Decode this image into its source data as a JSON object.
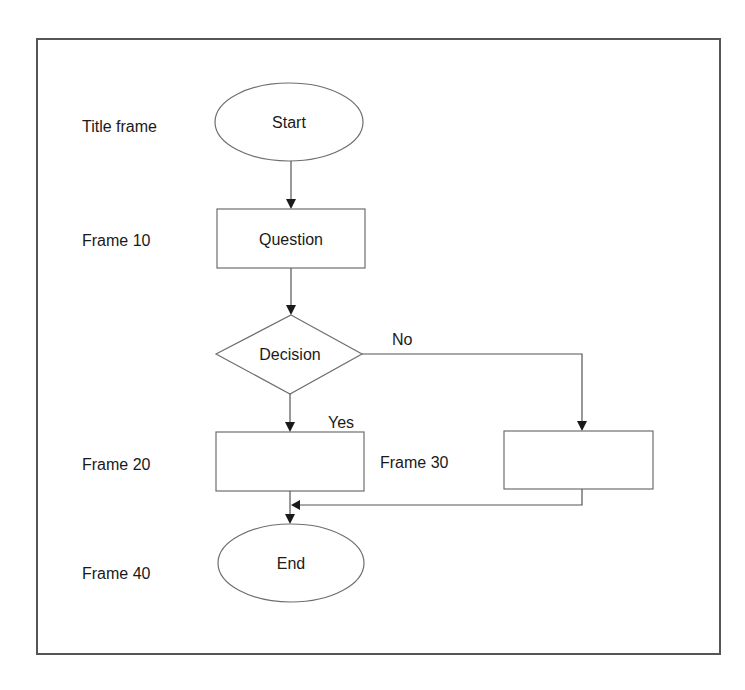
{
  "diagram": {
    "type": "flowchart",
    "colors": {
      "stroke": "#6e6e6e",
      "frame": "#555555",
      "text": "#1a1a1a",
      "background": "#ffffff"
    },
    "row_labels": {
      "title_frame": "Title frame",
      "frame_10": "Frame 10",
      "frame_20": "Frame 20",
      "frame_30": "Frame 30",
      "frame_40": "Frame 40"
    },
    "nodes": {
      "start": {
        "shape": "ellipse",
        "label": "Start"
      },
      "question": {
        "shape": "rectangle",
        "label": "Question"
      },
      "decision": {
        "shape": "diamond",
        "label": "Decision"
      },
      "frame20_box": {
        "shape": "rectangle",
        "label": ""
      },
      "frame30_box": {
        "shape": "rectangle",
        "label": ""
      },
      "end": {
        "shape": "ellipse",
        "label": "End"
      }
    },
    "edge_labels": {
      "no": "No",
      "yes": "Yes"
    },
    "edges": [
      {
        "from": "start",
        "to": "question"
      },
      {
        "from": "question",
        "to": "decision"
      },
      {
        "from": "decision",
        "to": "frame20_box",
        "label": "Yes"
      },
      {
        "from": "decision",
        "to": "frame30_box",
        "label": "No"
      },
      {
        "from": "frame20_box",
        "to": "end"
      },
      {
        "from": "frame30_box",
        "to": "end"
      }
    ]
  }
}
